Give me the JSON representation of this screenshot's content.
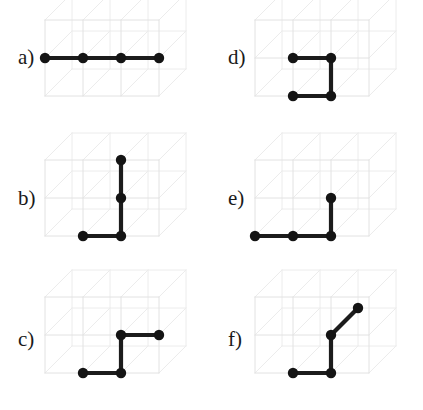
{
  "figure": {
    "background_color": "#ffffff",
    "lattice_line_color": "#e2e2e2",
    "chain_color": "#1c1c1c",
    "node_color": "#141414"
  },
  "lattice": {
    "cells_x": 3,
    "cells_y": 2,
    "cells_z": 1,
    "cell_width": 38,
    "cell_height": 38,
    "depth_dx": 27,
    "depth_dy": -27,
    "node_radius": 5.2,
    "bond_width": 4.2
  },
  "panels": [
    {
      "id": "a",
      "label": "a)",
      "label_x": 18,
      "label_y": 47,
      "origin_x": 45,
      "origin_y": 123,
      "chain_name": "straight-rod",
      "nodes": [
        {
          "x": 0,
          "y": 1,
          "z": 0
        },
        {
          "x": 1,
          "y": 1,
          "z": 0
        },
        {
          "x": 2,
          "y": 1,
          "z": 0
        },
        {
          "x": 3,
          "y": 1,
          "z": 0
        }
      ]
    },
    {
      "id": "b",
      "label": "b)",
      "label_x": 18,
      "label_y": 188,
      "origin_x": 45,
      "origin_y": 263,
      "chain_name": "tall-ell",
      "nodes": [
        {
          "x": 1,
          "y": 0,
          "z": 0
        },
        {
          "x": 2,
          "y": 0,
          "z": 0
        },
        {
          "x": 2,
          "y": 1,
          "z": 0
        },
        {
          "x": 2,
          "y": 2,
          "z": 0
        }
      ]
    },
    {
      "id": "c",
      "label": "c)",
      "label_x": 18,
      "label_y": 329,
      "origin_x": 45,
      "origin_y": 400,
      "chain_name": "zigzag-ess",
      "nodes": [
        {
          "x": 1,
          "y": 0,
          "z": 0
        },
        {
          "x": 2,
          "y": 0,
          "z": 0
        },
        {
          "x": 2,
          "y": 1,
          "z": 0
        },
        {
          "x": 3,
          "y": 1,
          "z": 0
        }
      ]
    },
    {
      "id": "d",
      "label": "d)",
      "label_x": 228,
      "label_y": 47,
      "origin_x": 255,
      "origin_y": 123,
      "chain_name": "u-turn",
      "nodes": [
        {
          "x": 1,
          "y": 0,
          "z": 0
        },
        {
          "x": 2,
          "y": 0,
          "z": 0
        },
        {
          "x": 2,
          "y": 1,
          "z": 0
        },
        {
          "x": 1,
          "y": 1,
          "z": 0
        }
      ]
    },
    {
      "id": "e",
      "label": "e)",
      "label_x": 228,
      "label_y": 188,
      "origin_x": 255,
      "origin_y": 263,
      "chain_name": "flat-ell",
      "nodes": [
        {
          "x": 0,
          "y": 0,
          "z": 0
        },
        {
          "x": 1,
          "y": 0,
          "z": 0
        },
        {
          "x": 2,
          "y": 0,
          "z": 0
        },
        {
          "x": 2,
          "y": 1,
          "z": 0
        }
      ]
    },
    {
      "id": "f",
      "label": "f)",
      "label_x": 228,
      "label_y": 329,
      "origin_x": 255,
      "origin_y": 400,
      "chain_name": "out-of-plane-ell",
      "nodes": [
        {
          "x": 1,
          "y": 0,
          "z": 0
        },
        {
          "x": 2,
          "y": 0,
          "z": 0
        },
        {
          "x": 2,
          "y": 1,
          "z": 0
        },
        {
          "x": 2,
          "y": 1,
          "z": 1
        }
      ]
    }
  ]
}
